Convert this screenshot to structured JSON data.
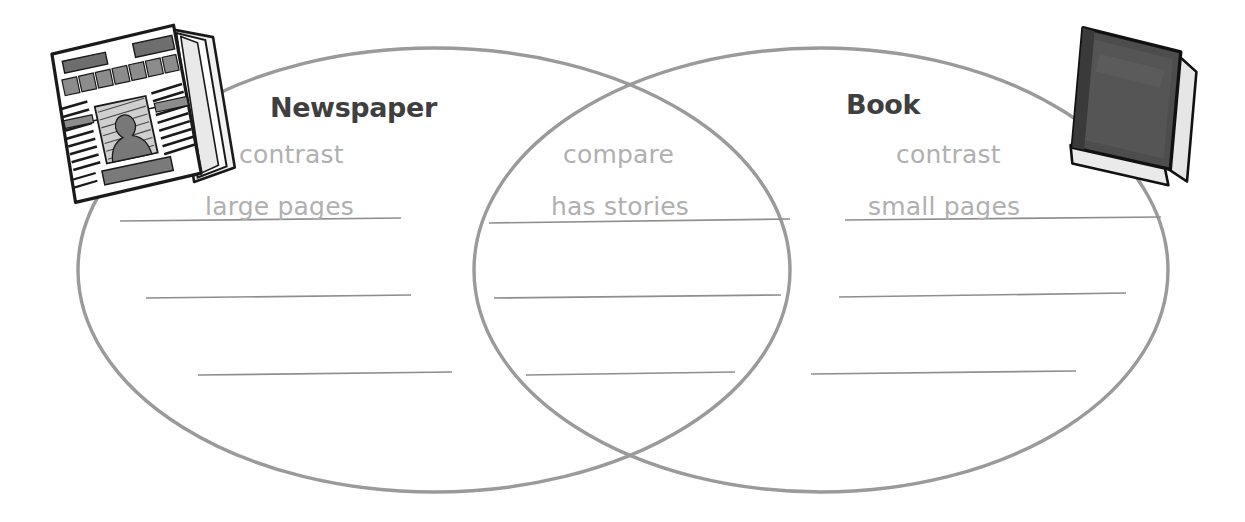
{
  "diagram": {
    "type": "venn-diagram",
    "title_left": "Newspaper",
    "title_right": "Book",
    "stroke_color": "#9a9a9a",
    "line_color": "#8e8e8e",
    "text_color": "#b0b0b0",
    "heading_color": "#3f3f3f",
    "background_color": "#ffffff"
  },
  "left_circle": {
    "heading": "Newspaper",
    "icon": "newspaper-icon",
    "entries": [
      {
        "text": "contrast",
        "underlined": false
      },
      {
        "text": "large pages",
        "underlined": true
      }
    ],
    "blank_lines": 2
  },
  "center_overlap": {
    "entries": [
      {
        "text": "compare",
        "underlined": false
      },
      {
        "text": "has stories",
        "underlined": true
      }
    ],
    "blank_lines": 2
  },
  "right_circle": {
    "heading": "Book",
    "icon": "book-icon",
    "entries": [
      {
        "text": "contrast",
        "underlined": false
      },
      {
        "text": "small pages",
        "underlined": true
      }
    ],
    "blank_lines": 2
  }
}
